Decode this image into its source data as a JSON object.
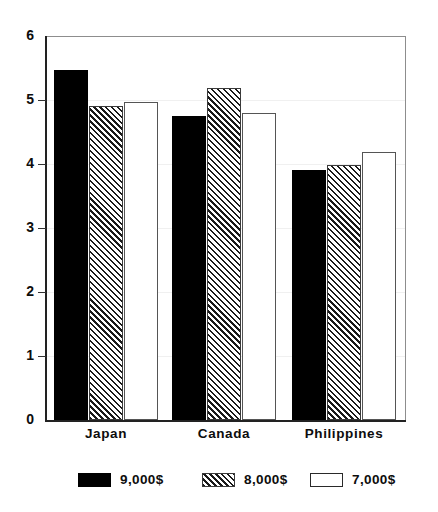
{
  "chart_data": {
    "type": "bar",
    "title": "",
    "xlabel": "",
    "ylabel": "",
    "categories": [
      "Japan",
      "Canada",
      "Philippines"
    ],
    "series": [
      {
        "name": "9,000$",
        "pattern": "solid",
        "values": [
          5.47,
          4.75,
          3.9
        ]
      },
      {
        "name": "8,000$",
        "pattern": "hatch",
        "values": [
          4.91,
          5.19,
          3.98
        ]
      },
      {
        "name": "7,000$",
        "pattern": "open",
        "values": [
          4.97,
          4.8,
          4.19
        ]
      }
    ],
    "ylim": [
      0,
      6
    ],
    "yticks": [
      0,
      1,
      2,
      3,
      4,
      5,
      6
    ],
    "ytick_labels": [
      "0",
      "1",
      "2",
      "3",
      "4",
      "5",
      "6"
    ],
    "grid": true,
    "legend_position": "bottom"
  }
}
